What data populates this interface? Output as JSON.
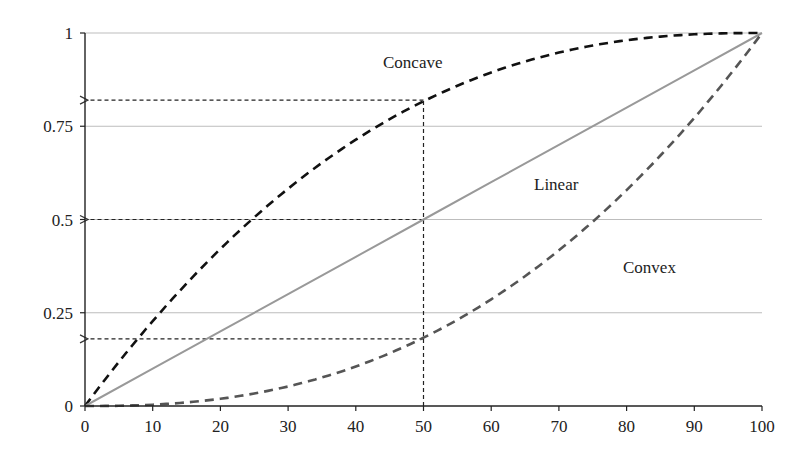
{
  "chart_data": {
    "type": "line",
    "title": "",
    "xlabel": "",
    "ylabel": "",
    "xlim": [
      0,
      100
    ],
    "ylim": [
      0,
      1
    ],
    "x_ticks": [
      0,
      10,
      20,
      30,
      40,
      50,
      60,
      70,
      80,
      90,
      100
    ],
    "y_ticks": [
      0,
      0.25,
      0.5,
      0.75,
      1
    ],
    "y_tick_labels": [
      "0",
      "0.25",
      "0.5",
      "0.75",
      "1"
    ],
    "grid": "horizontal",
    "legend": "none (inline curve labels)",
    "series": [
      {
        "name": "Concave",
        "style": "dashed",
        "color": "#111111",
        "x": [
          0,
          10,
          20,
          30,
          40,
          50,
          60,
          70,
          80,
          90,
          100
        ],
        "values": [
          0,
          0.27,
          0.47,
          0.62,
          0.74,
          0.82,
          0.89,
          0.94,
          0.97,
          0.99,
          1.0
        ]
      },
      {
        "name": "Linear",
        "style": "solid",
        "color": "#999999",
        "x": [
          0,
          10,
          20,
          30,
          40,
          50,
          60,
          70,
          80,
          90,
          100
        ],
        "values": [
          0,
          0.1,
          0.2,
          0.3,
          0.4,
          0.5,
          0.6,
          0.7,
          0.8,
          0.9,
          1.0
        ]
      },
      {
        "name": "Convex",
        "style": "dashed",
        "color": "#555555",
        "x": [
          0,
          10,
          20,
          30,
          40,
          50,
          60,
          70,
          80,
          90,
          100
        ],
        "values": [
          0,
          0.01,
          0.05,
          0.08,
          0.12,
          0.18,
          0.26,
          0.38,
          0.53,
          0.73,
          1.0
        ]
      }
    ],
    "annotations": [
      {
        "type": "dotted-vertical",
        "x": 50,
        "from_y": 0,
        "to_y": 0.82
      },
      {
        "type": "dotted-arrow-to-y-axis",
        "y": 0.82,
        "from_x": 50
      },
      {
        "type": "dotted-arrow-to-y-axis",
        "y": 0.5,
        "from_x": 50
      },
      {
        "type": "dotted-arrow-to-y-axis",
        "y": 0.18,
        "from_x": 50
      },
      {
        "type": "text",
        "text": "Concave",
        "x": 44,
        "y": 0.93
      },
      {
        "type": "text",
        "text": "Linear",
        "x": 66,
        "y": 0.6
      },
      {
        "type": "text",
        "text": "Convex",
        "x": 79,
        "y": 0.37
      }
    ]
  },
  "labels": {
    "concave": "Concave",
    "linear": "Linear",
    "convex": "Convex"
  },
  "axis": {
    "x_ticks": [
      "0",
      "10",
      "20",
      "30",
      "40",
      "50",
      "60",
      "70",
      "80",
      "90",
      "100"
    ],
    "y_ticks": [
      "0",
      "0.25",
      "0.5",
      "0.75",
      "1"
    ]
  }
}
